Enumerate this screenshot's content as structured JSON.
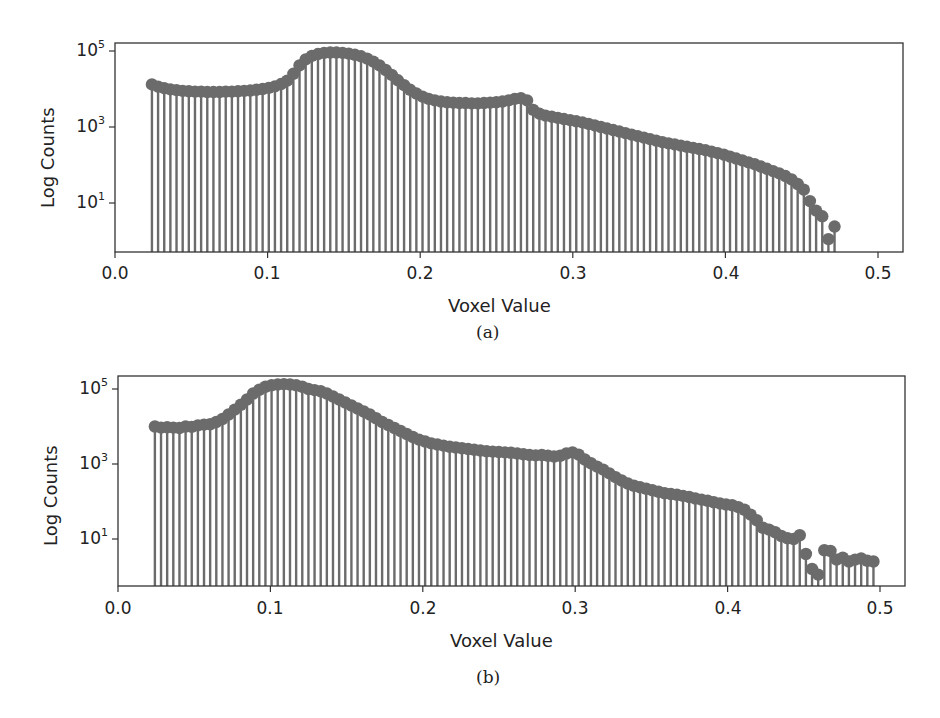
{
  "colors": {
    "stem": "#6b6b6b",
    "marker": "#6b6b6b",
    "axis": "#333333",
    "background": "#ffffff"
  },
  "chart_data": [
    {
      "id": "a",
      "type": "stem",
      "title": "",
      "caption": "(a)",
      "xlabel": "Voxel Value",
      "ylabel": "Log Counts",
      "yscale": "log",
      "xlim": [
        0.0,
        0.516
      ],
      "ylim_log10": [
        -0.3,
        5.2
      ],
      "xticks": [
        0.0,
        0.1,
        0.2,
        0.3,
        0.4,
        0.5
      ],
      "xtick_labels": [
        "0.0",
        "0.1",
        "0.2",
        "0.3",
        "0.4",
        "0.5"
      ],
      "yticks_log10": [
        1,
        3,
        5
      ],
      "ytick_labels": [
        {
          "base": "10",
          "exp": "1"
        },
        {
          "base": "10",
          "exp": "3"
        },
        {
          "base": "10",
          "exp": "5"
        }
      ],
      "grid": false,
      "x_step": 0.00403,
      "x_start": 0.0242,
      "log10_counts": [
        4.12,
        4.06,
        4.02,
        3.99,
        3.97,
        3.95,
        3.94,
        3.93,
        3.93,
        3.92,
        3.92,
        3.92,
        3.93,
        3.93,
        3.94,
        3.95,
        3.96,
        3.98,
        4.0,
        4.03,
        4.07,
        4.13,
        4.22,
        4.4,
        4.62,
        4.78,
        4.87,
        4.92,
        4.95,
        4.96,
        4.96,
        4.95,
        4.93,
        4.9,
        4.86,
        4.8,
        4.72,
        4.62,
        4.5,
        4.37,
        4.23,
        4.1,
        3.98,
        3.88,
        3.8,
        3.74,
        3.7,
        3.67,
        3.65,
        3.64,
        3.63,
        3.63,
        3.62,
        3.62,
        3.63,
        3.64,
        3.65,
        3.67,
        3.7,
        3.74,
        3.76,
        3.7,
        3.45,
        3.35,
        3.3,
        3.27,
        3.24,
        3.21,
        3.18,
        3.15,
        3.12,
        3.08,
        3.04,
        3.0,
        2.96,
        2.92,
        2.88,
        2.84,
        2.8,
        2.76,
        2.72,
        2.68,
        2.64,
        2.6,
        2.57,
        2.54,
        2.51,
        2.48,
        2.45,
        2.42,
        2.39,
        2.35,
        2.31,
        2.27,
        2.22,
        2.17,
        2.12,
        2.07,
        2.02,
        1.96,
        1.9,
        1.84,
        1.78,
        1.71,
        1.62,
        1.5,
        1.35,
        1.05,
        0.8,
        0.65,
        0.05,
        0.38
      ],
      "layout": {
        "top": 0,
        "height": 340,
        "plot_left": 115,
        "plot_right": 903,
        "plot_top": 43,
        "plot_bottom": 252,
        "x0_px": 115,
        "x05_px": 878,
        "y_decade_px": 38,
        "y_log1_px": 203
      }
    },
    {
      "id": "b",
      "type": "stem",
      "title": "",
      "caption": "(b)",
      "xlabel": "Voxel Value",
      "ylabel": "Log Counts",
      "yscale": "log",
      "xlim": [
        0.0,
        0.516
      ],
      "ylim_log10": [
        -0.25,
        5.3
      ],
      "xticks": [
        0.0,
        0.1,
        0.2,
        0.3,
        0.4,
        0.5
      ],
      "xtick_labels": [
        "0.0",
        "0.1",
        "0.2",
        "0.3",
        "0.4",
        "0.5"
      ],
      "yticks_log10": [
        1,
        3,
        5
      ],
      "ytick_labels": [
        {
          "base": "10",
          "exp": "1"
        },
        {
          "base": "10",
          "exp": "3"
        },
        {
          "base": "10",
          "exp": "5"
        }
      ],
      "grid": false,
      "x_step": 0.00403,
      "x_start": 0.0242,
      "log10_counts": [
        4.0,
        3.97,
        3.98,
        3.97,
        3.96,
        4.0,
        3.99,
        4.03,
        4.05,
        4.06,
        4.12,
        4.2,
        4.32,
        4.45,
        4.58,
        4.72,
        4.88,
        4.98,
        5.06,
        5.1,
        5.12,
        5.13,
        5.12,
        5.1,
        5.06,
        5.0,
        4.97,
        4.94,
        4.88,
        4.8,
        4.72,
        4.64,
        4.56,
        4.48,
        4.4,
        4.32,
        4.22,
        4.12,
        4.04,
        3.96,
        3.88,
        3.8,
        3.72,
        3.65,
        3.6,
        3.55,
        3.52,
        3.49,
        3.46,
        3.44,
        3.42,
        3.4,
        3.38,
        3.36,
        3.34,
        3.33,
        3.32,
        3.31,
        3.3,
        3.28,
        3.26,
        3.24,
        3.23,
        3.24,
        3.22,
        3.2,
        3.22,
        3.28,
        3.31,
        3.25,
        3.12,
        3.02,
        2.93,
        2.85,
        2.75,
        2.65,
        2.56,
        2.48,
        2.42,
        2.38,
        2.34,
        2.3,
        2.26,
        2.22,
        2.2,
        2.18,
        2.15,
        2.12,
        2.08,
        2.05,
        2.02,
        1.98,
        1.95,
        1.92,
        1.9,
        1.85,
        1.78,
        1.65,
        1.5,
        1.3,
        1.25,
        1.18,
        1.08,
        1.02,
        1.0,
        1.1,
        0.6,
        0.2,
        0.05,
        0.7,
        0.68,
        0.45,
        0.5,
        0.4,
        0.45,
        0.48,
        0.42,
        0.4
      ],
      "layout": {
        "top": 333,
        "height": 385,
        "plot_left": 118,
        "plot_right": 905,
        "plot_top": 376,
        "plot_bottom": 586,
        "x0_px": 118,
        "x05_px": 880,
        "y_decade_px": 37.5,
        "y_log1_px": 539
      }
    }
  ]
}
